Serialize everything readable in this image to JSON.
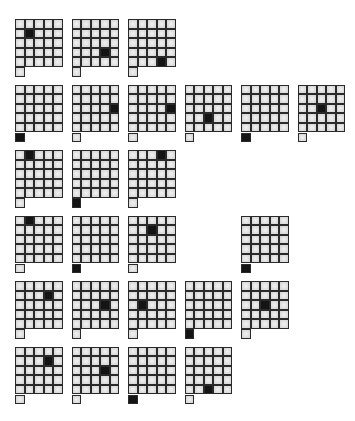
{
  "grid": {
    "rows": 5,
    "cols": 5,
    "extra_cell": "below bottom-left"
  },
  "colors": {
    "filled": "#141414",
    "empty": "#e6e6e6",
    "border": "#2a2a2a"
  },
  "rows": [
    {
      "glyphs": [
        {
          "slot": 0,
          "filled": [
            1,
            1
          ]
        },
        {
          "slot": 1,
          "filled": [
            3,
            3
          ]
        },
        {
          "slot": 2,
          "filled": [
            4,
            3
          ]
        }
      ]
    },
    {
      "glyphs": [
        {
          "slot": 0,
          "filled": "extra"
        },
        {
          "slot": 1,
          "filled": [
            2,
            4
          ]
        },
        {
          "slot": 2,
          "filled": [
            2,
            4
          ]
        },
        {
          "slot": 3,
          "filled": [
            3,
            2
          ]
        },
        {
          "slot": 4,
          "filled": "extra"
        },
        {
          "slot": 5,
          "filled": [
            2,
            2
          ]
        }
      ]
    },
    {
      "glyphs": [
        {
          "slot": 0,
          "filled": [
            0,
            1
          ]
        },
        {
          "slot": 1,
          "filled": "extra"
        },
        {
          "slot": 2,
          "filled": [
            0,
            3
          ]
        }
      ]
    },
    {
      "glyphs": [
        {
          "slot": 0,
          "filled": [
            0,
            1
          ]
        },
        {
          "slot": 1,
          "filled": "extra"
        },
        {
          "slot": 2,
          "filled": [
            1,
            2
          ]
        },
        {
          "slot": 4,
          "filled": "extra"
        }
      ]
    },
    {
      "glyphs": [
        {
          "slot": 0,
          "filled": [
            1,
            3
          ]
        },
        {
          "slot": 1,
          "filled": [
            2,
            3
          ]
        },
        {
          "slot": 2,
          "filled": [
            2,
            1
          ]
        },
        {
          "slot": 3,
          "filled": "extra"
        },
        {
          "slot": 4,
          "filled": [
            2,
            2
          ]
        }
      ]
    },
    {
      "glyphs": [
        {
          "slot": 0,
          "filled": [
            1,
            3
          ]
        },
        {
          "slot": 1,
          "filled": [
            2,
            3
          ]
        },
        {
          "slot": 2,
          "filled": "extra"
        },
        {
          "slot": 3,
          "filled": [
            4,
            2
          ]
        }
      ]
    }
  ]
}
